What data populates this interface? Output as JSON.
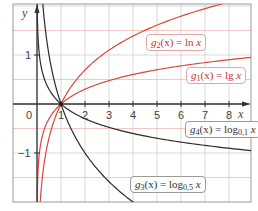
{
  "chart_data": {
    "type": "line",
    "title": "",
    "xlabel": "x",
    "ylabel": "y",
    "xlim": [
      -1,
      8.9
    ],
    "ylim": [
      -2,
      2.05
    ],
    "grid": true,
    "x_ticks": [
      "0",
      "1",
      "2",
      "3",
      "4",
      "5",
      "6",
      "7",
      "8"
    ],
    "y_ticks": [
      "1",
      "-1"
    ],
    "series": [
      {
        "name": "g2(x) = ln x",
        "base": 2.718281828,
        "color": "#d9473f",
        "label_box": "red",
        "x": [
          0.2,
          0.5,
          1,
          2,
          4,
          6,
          8
        ],
        "values": [
          -1.609,
          -0.693,
          0,
          0.693,
          1.386,
          1.792,
          2.079
        ]
      },
      {
        "name": "g1(x) = lg x",
        "base": 10,
        "color": "#d9473f",
        "label_box": "red",
        "x": [
          0.05,
          0.1,
          0.5,
          1,
          2,
          4,
          8,
          8.9
        ],
        "values": [
          -1.301,
          -1,
          -0.301,
          0,
          0.301,
          0.602,
          0.903,
          0.949
        ]
      },
      {
        "name": "g4(x) = log0.1 x",
        "base": 0.1,
        "color": "#2b2b2b",
        "label_box": "dark",
        "x": [
          0.05,
          0.1,
          0.5,
          1,
          2,
          4,
          8,
          8.9
        ],
        "values": [
          1.301,
          1,
          0.301,
          0,
          -0.301,
          -0.602,
          -0.903,
          -0.949
        ]
      },
      {
        "name": "g3(x) = log0.5 x",
        "base": 0.5,
        "color": "#2b2b2b",
        "label_box": "dark",
        "x": [
          0.25,
          0.5,
          1,
          2,
          4
        ],
        "values": [
          2,
          1,
          0,
          -1,
          -2
        ]
      }
    ]
  },
  "axes": {
    "x_name": "x",
    "y_name": "y",
    "x_tick_labels": [
      "0",
      "1",
      "2",
      "3",
      "4",
      "5",
      "6",
      "7",
      "8"
    ],
    "y_tick_labels": {
      "pos1": "1",
      "neg1": "−1"
    }
  },
  "labels": {
    "g2": {
      "fn": "g",
      "sub": "2",
      "rest": "(x) = ln ",
      "var": "x"
    },
    "g1": {
      "fn": "g",
      "sub": "1",
      "rest": "(x) = lg ",
      "var": "x"
    },
    "g4": {
      "fn": "g",
      "sub": "4",
      "rest": "(x) = log",
      "base": "0,1",
      "var": "x"
    },
    "g3": {
      "fn": "g",
      "sub": "3",
      "rest": "(x) = log",
      "base": "0,5",
      "var": "x"
    }
  },
  "colors": {
    "red_curve": "#d9473f",
    "dark_curve": "#2b2b2b",
    "grid_grey": "#cfcfcf",
    "grid_red": "#f0b9b4",
    "axis": "#333333",
    "frame": "#9a9a9a"
  }
}
